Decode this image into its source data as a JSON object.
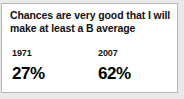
{
  "callout": {
    "headline": "Chances are very good that I will make at least a B average",
    "columns": [
      {
        "year": "1971",
        "value": "27%"
      },
      {
        "year": "2007",
        "value": "62%"
      }
    ]
  },
  "chart_data": {
    "type": "table",
    "title": "Chances are very good that I will make at least a B average",
    "categories": [
      "1971",
      "2007"
    ],
    "values": [
      27,
      62
    ],
    "value_labels": [
      "27%",
      "62%"
    ],
    "ylabel": "Percent of respondents",
    "xlabel": "Year",
    "ylim": [
      0,
      100
    ],
    "grid": false,
    "legend": "none"
  },
  "colors": {
    "card_background": "#ffffff",
    "page_background": "#e9e9e9",
    "border": "#b7b7b7",
    "text": "#111111",
    "value_text": "#000000"
  }
}
